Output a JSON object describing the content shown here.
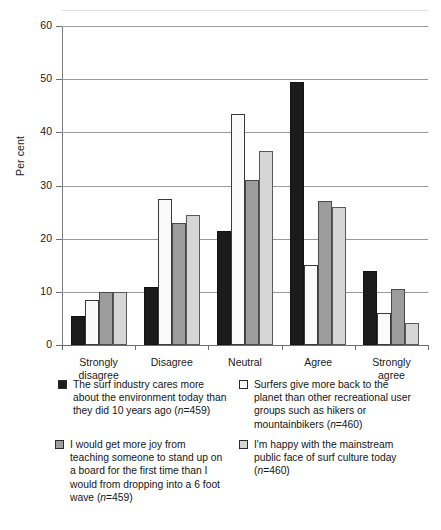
{
  "chart_data": {
    "type": "bar",
    "title": "",
    "xlabel": "",
    "ylabel": "Per cent",
    "ylim": [
      0,
      60
    ],
    "yticks": [
      0,
      10,
      20,
      30,
      40,
      50,
      60
    ],
    "grid": true,
    "legend_position": "below",
    "categories": [
      "Strongly\ndisagree",
      "Disagree",
      "Neutral",
      "Agree",
      "Strongly\nagree"
    ],
    "series": [
      {
        "name": "The surf industry cares more about the environment today than they did 10 years ago (n=459)",
        "short_name": "surf-industry-cares",
        "color": "#1b1b1b",
        "swatch": "black",
        "n": 459,
        "values": [
          5.5,
          11.0,
          21.5,
          49.5,
          14.0
        ]
      },
      {
        "name": "Surfers give more back to the planet than other recreational user groups such as hikers or mountainbikers (n=460)",
        "short_name": "surfers-give-more-back",
        "color": "#fafafa",
        "swatch": "white",
        "n": 460,
        "values": [
          8.5,
          27.5,
          43.5,
          15.0,
          6.0
        ]
      },
      {
        "name": "I would get more joy from teaching someone to stand up on a board for the first time than I would from dropping into a 6 foot wave (n=459)",
        "short_name": "more-joy-teaching",
        "color": "#9d9d9d",
        "swatch": "dark-gray",
        "n": 459,
        "values": [
          10.0,
          23.0,
          31.0,
          27.0,
          10.5
        ]
      },
      {
        "name": "I'm happy with the mainstream public face of surf culture today (n=460)",
        "short_name": "happy-mainstream-face",
        "color": "#d6d6d6",
        "swatch": "light-gray",
        "n": 460,
        "values": [
          10.0,
          24.5,
          36.5,
          26.0,
          4.2
        ]
      }
    ]
  },
  "axis": {
    "y_label": "Per cent",
    "y_ticks": [
      "0",
      "10",
      "20",
      "30",
      "40",
      "50",
      "60"
    ],
    "x_ticks": [
      "Strongly\ndisagree",
      "Disagree",
      "Neutral",
      "Agree",
      "Strongly\nagree"
    ]
  },
  "legend": {
    "items": [
      {
        "swatch": "black",
        "line1": "The surf industry cares more",
        "line2": "about the environment today than",
        "line3": "they did 10 years ago (",
        "n_label": "n",
        "n_value": "=459)",
        "full_text": "The surf industry cares more about the environment today than they did 10 years ago (n=459)"
      },
      {
        "swatch": "white",
        "line1": "Surfers give more back to the",
        "line2": "planet than other recreational user",
        "line3": "groups such as hikers or",
        "line4": "mountainbikers (",
        "n_label": "n",
        "n_value": "=460)",
        "full_text": "Surfers give more back to the planet than other recreational user groups such as hikers or mountainbikers (n=460)"
      },
      {
        "swatch": "dark-gray",
        "line1": "I would get more joy from",
        "line2": "teaching someone to stand up on",
        "line3": "a board for the first time than I",
        "line4": "would from dropping into a 6 foot",
        "line5": "wave (",
        "n_label": "n",
        "n_value": "=459)",
        "full_text": "I would get more joy from teaching someone to stand up on a board for the first time than I would from dropping into a 6 foot wave (n=459)"
      },
      {
        "swatch": "light-gray",
        "line1": "I'm happy with the mainstream",
        "line2": "public face of surf culture today",
        "line3": "(",
        "n_label": "n",
        "n_value": "=460)",
        "full_text": "I'm happy with the mainstream public face of surf culture today (n=460)"
      }
    ]
  },
  "colors": {
    "series_black": "#1b1b1b",
    "series_white": "#fafafa",
    "series_dark_gray": "#9d9d9d",
    "series_light_gray": "#d6d6d6",
    "gridline": "#9a9a9a",
    "axis": "#6d6d6d",
    "background": "#ffffff"
  }
}
